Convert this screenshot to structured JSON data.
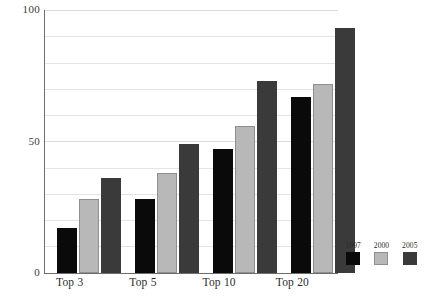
{
  "chart_data": {
    "type": "bar",
    "title": "",
    "subtitle": "",
    "xlabel": "",
    "ylabel": "",
    "categories": [
      "Top 3",
      "Top 5",
      "Top 10",
      "Top 20"
    ],
    "series": [
      {
        "name": "1997",
        "color": "#0a0a0a",
        "values": [
          17,
          28,
          47,
          67
        ]
      },
      {
        "name": "2000",
        "color": "#b8b8b8",
        "values": [
          28,
          38,
          56,
          72
        ]
      },
      {
        "name": "2005",
        "color": "#3a3a3a",
        "values": [
          36,
          49,
          73,
          93
        ]
      }
    ],
    "ylim": [
      0,
      100
    ],
    "y_major_ticks": [
      0,
      50,
      100
    ],
    "y_major_tick_labels": [
      "0",
      "50",
      "100"
    ],
    "y_minor_tick_step": 10,
    "grid": true,
    "grid_axis": "y",
    "legend": true,
    "legend_position": "bottom-right",
    "legend_entries": [
      "1997",
      "2000",
      "2005"
    ],
    "axis_color": "#6d6d6d",
    "gridline_color": "#e4e4e4",
    "background": "#ffffff"
  },
  "axes": {
    "y_labels": [
      {
        "text": "100",
        "value": 100
      },
      {
        "text": "50",
        "value": 50
      },
      {
        "text": "0",
        "value": 0
      }
    ],
    "x_labels": [
      "Top 3",
      "Top 5",
      "Top 10",
      "Top 20"
    ]
  },
  "legend": {
    "items": [
      {
        "label": "1997",
        "color": "#0a0a0a"
      },
      {
        "label": "2000",
        "color": "#b8b8b8"
      },
      {
        "label": "2005",
        "color": "#3a3a3a"
      }
    ]
  }
}
